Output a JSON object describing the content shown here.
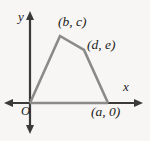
{
  "figure": {
    "name": "coordinate-plane-quadrilateral",
    "type": "geometry-diagram",
    "background_color": "#f7f6f4",
    "axis_color": "#3a3a3a",
    "shape_color": "#8a8a8a",
    "text_color": "#1a1a1a"
  },
  "axes": {
    "x_label": "x",
    "y_label": "y",
    "origin_label": "O",
    "x_axis": {
      "x1": 5,
      "y1": 103,
      "x2": 142,
      "y2": 103,
      "arrows": "both"
    },
    "y_axis": {
      "x1": 30,
      "y1": 12,
      "x2": 30,
      "y2": 133,
      "arrows": "both"
    }
  },
  "shape": {
    "type": "quadrilateral",
    "stroke_width": 2.6,
    "vertices": [
      {
        "label": "O",
        "text": "",
        "x": 30,
        "y": 103
      },
      {
        "label": "(b, c)",
        "text": "(b, c)",
        "x": 60,
        "y": 36
      },
      {
        "label": "(d, e)",
        "text": "(d, e)",
        "x": 84,
        "y": 50
      },
      {
        "label": "(a, 0)",
        "text": "(a, 0)",
        "x": 108,
        "y": 103
      }
    ],
    "path": "M 30 103 L 60 36 L 84 50 L 108 103"
  },
  "labels": {
    "peak_point": "(b, c)",
    "right_point": "(d, e)",
    "base_point": "(a, 0)",
    "origin": "O",
    "x_axis": "x",
    "y_axis": "y"
  }
}
